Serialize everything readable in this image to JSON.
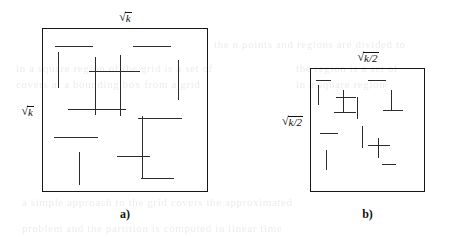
{
  "figure": {
    "panels": [
      {
        "id": "panel-a",
        "caption": "a)",
        "top_label": {
          "radical_sign": "√",
          "radicand": "k"
        },
        "side_label": {
          "radical_sign": "√",
          "radicand": "k"
        },
        "square": {
          "x": 42,
          "y": 28,
          "w": 166,
          "h": 164
        },
        "segments": [
          {
            "orient": "h",
            "x": 55,
            "y": 46,
            "len": 38
          },
          {
            "orient": "h",
            "x": 133,
            "y": 46,
            "len": 38
          },
          {
            "orient": "v",
            "x": 58,
            "y": 52,
            "len": 36
          },
          {
            "orient": "v",
            "x": 95,
            "y": 57,
            "len": 58
          },
          {
            "orient": "h",
            "x": 89,
            "y": 71,
            "len": 51
          },
          {
            "orient": "v",
            "x": 120,
            "y": 55,
            "len": 61
          },
          {
            "orient": "v",
            "x": 178,
            "y": 60,
            "len": 40
          },
          {
            "orient": "h",
            "x": 68,
            "y": 109,
            "len": 58
          },
          {
            "orient": "h",
            "x": 138,
            "y": 118,
            "len": 44
          },
          {
            "orient": "v",
            "x": 142,
            "y": 116,
            "len": 62
          },
          {
            "orient": "h",
            "x": 54,
            "y": 137,
            "len": 44
          },
          {
            "orient": "h",
            "x": 117,
            "y": 156,
            "len": 33
          },
          {
            "orient": "v",
            "x": 79,
            "y": 152,
            "len": 33
          },
          {
            "orient": "h",
            "x": 141,
            "y": 178,
            "len": 33
          }
        ]
      },
      {
        "id": "panel-b",
        "caption": "b)",
        "top_label": {
          "radical_sign": "√",
          "radicand": "k/2"
        },
        "side_label": {
          "radical_sign": "√",
          "radicand": "k/2"
        },
        "square": {
          "x": 310,
          "y": 68,
          "w": 115,
          "h": 124
        },
        "segments": [
          {
            "orient": "h",
            "x": 316,
            "y": 80,
            "len": 15
          },
          {
            "orient": "h",
            "x": 368,
            "y": 80,
            "len": 18
          },
          {
            "orient": "v",
            "x": 318,
            "y": 85,
            "len": 20
          },
          {
            "orient": "v",
            "x": 343,
            "y": 90,
            "len": 22
          },
          {
            "orient": "h",
            "x": 336,
            "y": 97,
            "len": 20
          },
          {
            "orient": "v",
            "x": 357,
            "y": 97,
            "len": 22
          },
          {
            "orient": "v",
            "x": 391,
            "y": 90,
            "len": 20
          },
          {
            "orient": "h",
            "x": 334,
            "y": 112,
            "len": 22
          },
          {
            "orient": "h",
            "x": 383,
            "y": 110,
            "len": 20
          },
          {
            "orient": "h",
            "x": 320,
            "y": 133,
            "len": 18
          },
          {
            "orient": "v",
            "x": 362,
            "y": 126,
            "len": 22
          },
          {
            "orient": "h",
            "x": 368,
            "y": 145,
            "len": 22
          },
          {
            "orient": "v",
            "x": 378,
            "y": 138,
            "len": 20
          },
          {
            "orient": "v",
            "x": 326,
            "y": 150,
            "len": 20
          },
          {
            "orient": "h",
            "x": 382,
            "y": 164,
            "len": 14
          }
        ]
      }
    ]
  },
  "background_ghost": {
    "visible": true,
    "lines": [
      {
        "x": 214,
        "y": 38,
        "size": 11,
        "text": "the n points and regions are divided to"
      },
      {
        "x": 16,
        "y": 62,
        "size": 11,
        "text": "in a square region of the grid is a set of"
      },
      {
        "x": 16,
        "y": 78,
        "size": 11,
        "text": "covers at a bounding box from a grid"
      },
      {
        "x": 296,
        "y": 62,
        "size": 11,
        "text": "the region is a set of"
      },
      {
        "x": 296,
        "y": 78,
        "size": 11,
        "text": "in a square region"
      },
      {
        "x": 22,
        "y": 196,
        "size": 11,
        "text": "a simple approach to the grid covers the approximated"
      },
      {
        "x": 22,
        "y": 222,
        "size": 11,
        "text": "problem and the partition is computed in linear time"
      }
    ]
  }
}
